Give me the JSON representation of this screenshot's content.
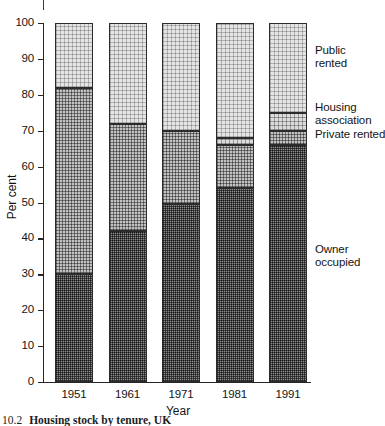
{
  "figure": {
    "caption_number": "10.2",
    "caption_text": "Housing stock by tenure, UK"
  },
  "chart_data": {
    "type": "bar",
    "stacked": true,
    "title": "",
    "xlabel": "Year",
    "ylabel": "Per cent",
    "categories": [
      "1951",
      "1961",
      "1971",
      "1981",
      "1991"
    ],
    "ylim": [
      0,
      100
    ],
    "yticks": [
      "0",
      "10",
      "20",
      "30",
      "40",
      "50",
      "60",
      "70",
      "80",
      "90",
      "100"
    ],
    "grid": false,
    "legend_position": "in-plot-right-callouts",
    "series": [
      {
        "name": "Owner occupied",
        "values": [
          30,
          42,
          49.5,
          54,
          66
        ],
        "fill": "dark-stipple",
        "color": "#8e8e8e"
      },
      {
        "name": "Private rented",
        "values": [
          52,
          30,
          20.5,
          12,
          4
        ],
        "fill": "medium-stipple",
        "color": "#c2c2c2"
      },
      {
        "name": "Housing association",
        "values": [
          0,
          0,
          0,
          2,
          5
        ],
        "fill": "light-stipple",
        "color": "#dcdcdc"
      },
      {
        "name": "Public rented",
        "values": [
          18,
          28,
          30,
          32,
          25
        ],
        "fill": "pale-stipple",
        "color": "#e4e4e4"
      }
    ],
    "cumulative_tops": {
      "1951": {
        "owner_occupied": 30,
        "private_rented": 82,
        "housing_association": 82,
        "public_rented": 100
      },
      "1961": {
        "owner_occupied": 42,
        "private_rented": 72,
        "housing_association": 72,
        "public_rented": 100
      },
      "1971": {
        "owner_occupied": 49.5,
        "private_rented": 70,
        "housing_association": 70,
        "public_rented": 100
      },
      "1981": {
        "owner_occupied": 54,
        "private_rented": 66,
        "housing_association": 68,
        "public_rented": 100
      },
      "1991": {
        "owner_occupied": 66,
        "private_rented": 70,
        "housing_association": 75,
        "public_rented": 100
      }
    },
    "annotations": [
      {
        "id": "public",
        "lines": [
          "Public",
          "rented"
        ]
      },
      {
        "id": "housing_association",
        "lines": [
          "Housing",
          "association"
        ]
      },
      {
        "id": "private",
        "lines": [
          "Private rented"
        ]
      },
      {
        "id": "owner",
        "lines": [
          "Owner",
          "occupied"
        ]
      }
    ]
  }
}
